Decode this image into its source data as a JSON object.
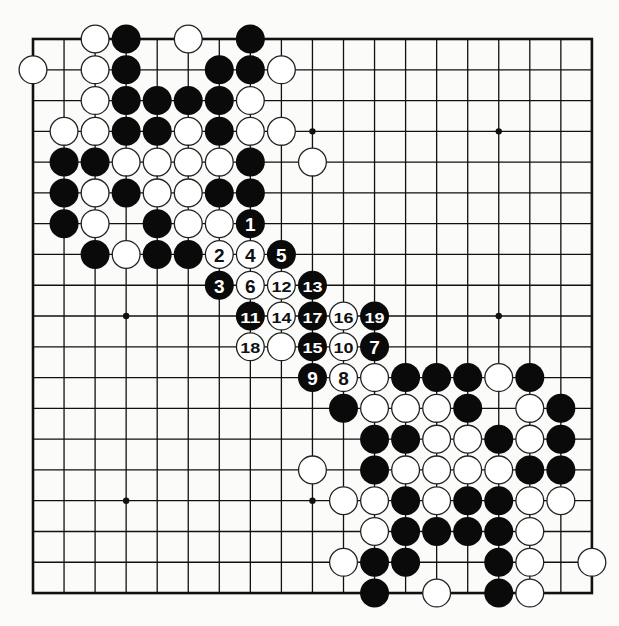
{
  "board": {
    "size": 19,
    "origin_x": 33,
    "origin_y": 39,
    "spacing_x": 31.05,
    "spacing_y": 30.78,
    "stone_radius": 14.5,
    "colors": {
      "background": "#fbfbf9",
      "line": "#111111",
      "black_stone": "#0a0a0a",
      "white_stone": "#ffffff",
      "stone_outline": "#222222"
    },
    "star_points": [
      [
        3,
        3
      ],
      [
        9,
        3
      ],
      [
        15,
        3
      ],
      [
        3,
        9
      ],
      [
        9,
        9
      ],
      [
        15,
        9
      ],
      [
        3,
        15
      ],
      [
        9,
        15
      ],
      [
        15,
        15
      ]
    ]
  },
  "stones": [
    {
      "c": "W",
      "x": 2,
      "y": 0
    },
    {
      "c": "B",
      "x": 3,
      "y": 0
    },
    {
      "c": "W",
      "x": 5,
      "y": 0
    },
    {
      "c": "B",
      "x": 7,
      "y": 0
    },
    {
      "c": "W",
      "x": 0,
      "y": 1
    },
    {
      "c": "W",
      "x": 2,
      "y": 1
    },
    {
      "c": "B",
      "x": 3,
      "y": 1
    },
    {
      "c": "B",
      "x": 6,
      "y": 1
    },
    {
      "c": "B",
      "x": 7,
      "y": 1
    },
    {
      "c": "W",
      "x": 8,
      "y": 1
    },
    {
      "c": "W",
      "x": 2,
      "y": 2
    },
    {
      "c": "B",
      "x": 3,
      "y": 2
    },
    {
      "c": "B",
      "x": 4,
      "y": 2
    },
    {
      "c": "B",
      "x": 5,
      "y": 2
    },
    {
      "c": "B",
      "x": 6,
      "y": 2
    },
    {
      "c": "W",
      "x": 7,
      "y": 2
    },
    {
      "c": "W",
      "x": 1,
      "y": 3
    },
    {
      "c": "W",
      "x": 2,
      "y": 3
    },
    {
      "c": "B",
      "x": 3,
      "y": 3
    },
    {
      "c": "B",
      "x": 4,
      "y": 3
    },
    {
      "c": "W",
      "x": 5,
      "y": 3
    },
    {
      "c": "B",
      "x": 6,
      "y": 3
    },
    {
      "c": "W",
      "x": 7,
      "y": 3
    },
    {
      "c": "W",
      "x": 8,
      "y": 3
    },
    {
      "c": "B",
      "x": 1,
      "y": 4
    },
    {
      "c": "B",
      "x": 2,
      "y": 4
    },
    {
      "c": "W",
      "x": 3,
      "y": 4
    },
    {
      "c": "W",
      "x": 4,
      "y": 4
    },
    {
      "c": "W",
      "x": 5,
      "y": 4
    },
    {
      "c": "W",
      "x": 6,
      "y": 4
    },
    {
      "c": "B",
      "x": 7,
      "y": 4
    },
    {
      "c": "W",
      "x": 9,
      "y": 4
    },
    {
      "c": "B",
      "x": 1,
      "y": 5
    },
    {
      "c": "W",
      "x": 2,
      "y": 5
    },
    {
      "c": "B",
      "x": 3,
      "y": 5
    },
    {
      "c": "W",
      "x": 4,
      "y": 5
    },
    {
      "c": "W",
      "x": 5,
      "y": 5
    },
    {
      "c": "B",
      "x": 6,
      "y": 5
    },
    {
      "c": "B",
      "x": 7,
      "y": 5
    },
    {
      "c": "B",
      "x": 1,
      "y": 6
    },
    {
      "c": "W",
      "x": 2,
      "y": 6
    },
    {
      "c": "B",
      "x": 4,
      "y": 6
    },
    {
      "c": "W",
      "x": 5,
      "y": 6
    },
    {
      "c": "W",
      "x": 6,
      "y": 6
    },
    {
      "c": "B",
      "x": 2,
      "y": 7
    },
    {
      "c": "W",
      "x": 3,
      "y": 7
    },
    {
      "c": "B",
      "x": 4,
      "y": 7
    },
    {
      "c": "B",
      "x": 5,
      "y": 7
    },
    {
      "c": "W",
      "x": 8,
      "y": 10
    },
    {
      "c": "W",
      "x": 11,
      "y": 11
    },
    {
      "c": "B",
      "x": 12,
      "y": 11
    },
    {
      "c": "B",
      "x": 13,
      "y": 11
    },
    {
      "c": "B",
      "x": 14,
      "y": 11
    },
    {
      "c": "W",
      "x": 15,
      "y": 11
    },
    {
      "c": "B",
      "x": 16,
      "y": 11
    },
    {
      "c": "B",
      "x": 10,
      "y": 12
    },
    {
      "c": "W",
      "x": 11,
      "y": 12
    },
    {
      "c": "W",
      "x": 12,
      "y": 12
    },
    {
      "c": "W",
      "x": 13,
      "y": 12
    },
    {
      "c": "B",
      "x": 14,
      "y": 12
    },
    {
      "c": "W",
      "x": 16,
      "y": 12
    },
    {
      "c": "B",
      "x": 17,
      "y": 12
    },
    {
      "c": "B",
      "x": 11,
      "y": 13
    },
    {
      "c": "B",
      "x": 12,
      "y": 13
    },
    {
      "c": "W",
      "x": 13,
      "y": 13
    },
    {
      "c": "W",
      "x": 14,
      "y": 13
    },
    {
      "c": "B",
      "x": 15,
      "y": 13
    },
    {
      "c": "W",
      "x": 16,
      "y": 13
    },
    {
      "c": "B",
      "x": 17,
      "y": 13
    },
    {
      "c": "W",
      "x": 9,
      "y": 14
    },
    {
      "c": "B",
      "x": 11,
      "y": 14
    },
    {
      "c": "W",
      "x": 12,
      "y": 14
    },
    {
      "c": "W",
      "x": 13,
      "y": 14
    },
    {
      "c": "W",
      "x": 14,
      "y": 14
    },
    {
      "c": "W",
      "x": 15,
      "y": 14
    },
    {
      "c": "B",
      "x": 16,
      "y": 14
    },
    {
      "c": "B",
      "x": 17,
      "y": 14
    },
    {
      "c": "W",
      "x": 10,
      "y": 15
    },
    {
      "c": "W",
      "x": 11,
      "y": 15
    },
    {
      "c": "B",
      "x": 12,
      "y": 15
    },
    {
      "c": "W",
      "x": 13,
      "y": 15
    },
    {
      "c": "B",
      "x": 14,
      "y": 15
    },
    {
      "c": "B",
      "x": 15,
      "y": 15
    },
    {
      "c": "W",
      "x": 16,
      "y": 15
    },
    {
      "c": "W",
      "x": 17,
      "y": 15
    },
    {
      "c": "W",
      "x": 11,
      "y": 16
    },
    {
      "c": "B",
      "x": 12,
      "y": 16
    },
    {
      "c": "B",
      "x": 13,
      "y": 16
    },
    {
      "c": "B",
      "x": 14,
      "y": 16
    },
    {
      "c": "B",
      "x": 15,
      "y": 16
    },
    {
      "c": "W",
      "x": 16,
      "y": 16
    },
    {
      "c": "W",
      "x": 10,
      "y": 17
    },
    {
      "c": "B",
      "x": 11,
      "y": 17
    },
    {
      "c": "B",
      "x": 12,
      "y": 17
    },
    {
      "c": "B",
      "x": 15,
      "y": 17
    },
    {
      "c": "W",
      "x": 16,
      "y": 17
    },
    {
      "c": "W",
      "x": 18,
      "y": 17
    },
    {
      "c": "B",
      "x": 11,
      "y": 18
    },
    {
      "c": "W",
      "x": 13,
      "y": 18
    },
    {
      "c": "B",
      "x": 15,
      "y": 18
    },
    {
      "c": "W",
      "x": 16,
      "y": 18
    }
  ],
  "moves": [
    {
      "n": "1",
      "c": "B",
      "x": 7,
      "y": 6
    },
    {
      "n": "2",
      "c": "W",
      "x": 6,
      "y": 7
    },
    {
      "n": "3",
      "c": "B",
      "x": 6,
      "y": 8
    },
    {
      "n": "4",
      "c": "W",
      "x": 7,
      "y": 7
    },
    {
      "n": "5",
      "c": "B",
      "x": 8,
      "y": 7
    },
    {
      "n": "6",
      "c": "W",
      "x": 7,
      "y": 8
    },
    {
      "n": "7",
      "c": "B",
      "x": 11,
      "y": 10
    },
    {
      "n": "8",
      "c": "W",
      "x": 10,
      "y": 11
    },
    {
      "n": "9",
      "c": "B",
      "x": 9,
      "y": 11
    },
    {
      "n": "10",
      "c": "W",
      "x": 10,
      "y": 10
    },
    {
      "n": "11",
      "c": "B",
      "x": 7,
      "y": 9
    },
    {
      "n": "12",
      "c": "W",
      "x": 8,
      "y": 8
    },
    {
      "n": "13",
      "c": "B",
      "x": 9,
      "y": 8
    },
    {
      "n": "14",
      "c": "W",
      "x": 8,
      "y": 9
    },
    {
      "n": "15",
      "c": "B",
      "x": 9,
      "y": 10
    },
    {
      "n": "16",
      "c": "W",
      "x": 10,
      "y": 9
    },
    {
      "n": "17",
      "c": "B",
      "x": 9,
      "y": 9
    },
    {
      "n": "18",
      "c": "W",
      "x": 7,
      "y": 10
    },
    {
      "n": "19",
      "c": "B",
      "x": 11,
      "y": 9
    }
  ]
}
